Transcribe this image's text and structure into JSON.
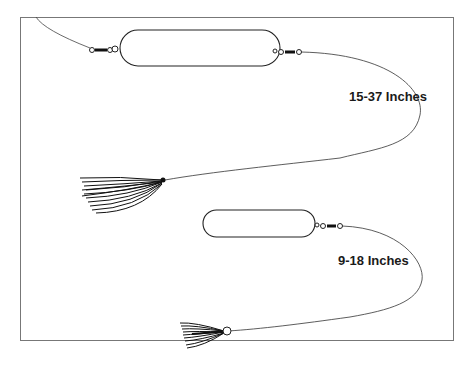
{
  "diagram": {
    "rigs": [
      {
        "name": "long-rig",
        "label": "15-37 Inches"
      },
      {
        "name": "short-rig",
        "label": "9-18 Inches"
      }
    ],
    "colors": {
      "line": "#222222",
      "frame": "#777777",
      "background": "#ffffff"
    }
  }
}
